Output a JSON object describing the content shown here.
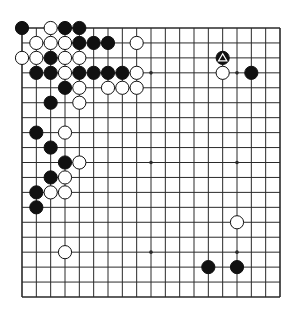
{
  "diagram": {
    "type": "go-board",
    "size": 19,
    "colors": {
      "line": "#2a2a2a",
      "black": "#111111",
      "white": "#ffffff",
      "background": "#ffffff"
    },
    "star_points": [
      [
        3,
        3
      ],
      [
        9,
        3
      ],
      [
        15,
        3
      ],
      [
        3,
        9
      ],
      [
        9,
        9
      ],
      [
        15,
        9
      ],
      [
        3,
        15
      ],
      [
        9,
        15
      ],
      [
        15,
        15
      ]
    ],
    "black_stones": [
      [
        0,
        0
      ],
      [
        3,
        0
      ],
      [
        4,
        0
      ],
      [
        4,
        1
      ],
      [
        5,
        1
      ],
      [
        6,
        1
      ],
      [
        2,
        2
      ],
      [
        14,
        2
      ],
      [
        1,
        3
      ],
      [
        2,
        3
      ],
      [
        4,
        3
      ],
      [
        5,
        3
      ],
      [
        6,
        3
      ],
      [
        7,
        3
      ],
      [
        16,
        3
      ],
      [
        3,
        4
      ],
      [
        2,
        5
      ],
      [
        1,
        7
      ],
      [
        2,
        8
      ],
      [
        3,
        9
      ],
      [
        2,
        10
      ],
      [
        1,
        11
      ],
      [
        1,
        12
      ],
      [
        13,
        16
      ],
      [
        15,
        16
      ]
    ],
    "white_stones": [
      [
        2,
        0
      ],
      [
        1,
        1
      ],
      [
        2,
        1
      ],
      [
        3,
        1
      ],
      [
        8,
        1
      ],
      [
        0,
        2
      ],
      [
        1,
        2
      ],
      [
        3,
        2
      ],
      [
        4,
        2
      ],
      [
        3,
        3
      ],
      [
        8,
        3
      ],
      [
        14,
        3
      ],
      [
        4,
        4
      ],
      [
        6,
        4
      ],
      [
        7,
        4
      ],
      [
        8,
        4
      ],
      [
        4,
        5
      ],
      [
        3,
        7
      ],
      [
        4,
        9
      ],
      [
        3,
        10
      ],
      [
        2,
        11
      ],
      [
        3,
        11
      ],
      [
        15,
        13
      ],
      [
        3,
        15
      ]
    ],
    "marked_stones": [
      {
        "point": [
          14,
          2
        ],
        "color": "black",
        "mark": "triangle"
      }
    ]
  }
}
